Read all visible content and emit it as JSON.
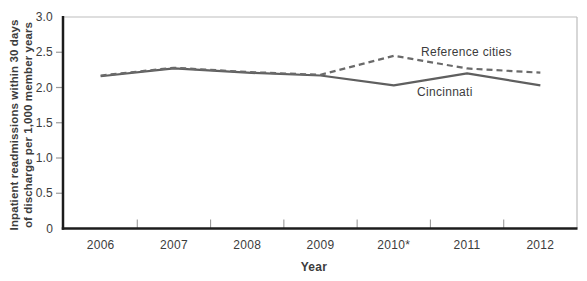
{
  "figure_title": "Inpatient readmissions line chart",
  "colors": {
    "background": "#ffffff",
    "axis_spine": "#1c1c1c",
    "frame_spine": "#bdbdbd",
    "tick_mark": "#9b9b9b",
    "tick_label_text": "#3c3c3c",
    "series_solid": "#5f5f5f",
    "series_dashed": "#6a6a6a",
    "annotation_text": "#3f3f3f"
  },
  "chart_data": {
    "type": "line",
    "categories": [
      "2006",
      "2007",
      "2008",
      "2009",
      "2010*",
      "2011",
      "2012"
    ],
    "series": [
      {
        "name": "Cincinnati",
        "values": [
          2.16,
          2.27,
          2.21,
          2.17,
          2.03,
          2.2,
          2.03
        ],
        "line_style": "solid",
        "label": "Cincinnati",
        "label_anchor": {
          "x": 417,
          "y": 96
        }
      },
      {
        "name": "Reference cities",
        "values": [
          2.17,
          2.28,
          2.22,
          2.18,
          2.45,
          2.27,
          2.21
        ],
        "line_style": "dashed",
        "label": "Reference cities",
        "label_anchor": {
          "x": 421,
          "y": 56
        }
      }
    ],
    "title": "",
    "xlabel": "Year",
    "ylabel_lines": [
      "Inpatient readmissions within 30 days",
      "of discharge per 1,000 member years"
    ],
    "yticks": [
      {
        "label": "3.0",
        "value": 3.0
      },
      {
        "label": "2.5",
        "value": 2.5
      },
      {
        "label": "2.0",
        "value": 2.0
      },
      {
        "label": "1.5",
        "value": 1.5
      },
      {
        "label": "1.0",
        "value": 1.0
      },
      {
        "label": "0.5",
        "value": 0.5
      },
      {
        "label": "0",
        "value": 0.0
      }
    ],
    "ylim": [
      0,
      3.0
    ],
    "grid": false,
    "legend_position": "inline-annotations",
    "x_axis_style": "category-between-ticks",
    "note_marker_on_x": "2010*"
  }
}
